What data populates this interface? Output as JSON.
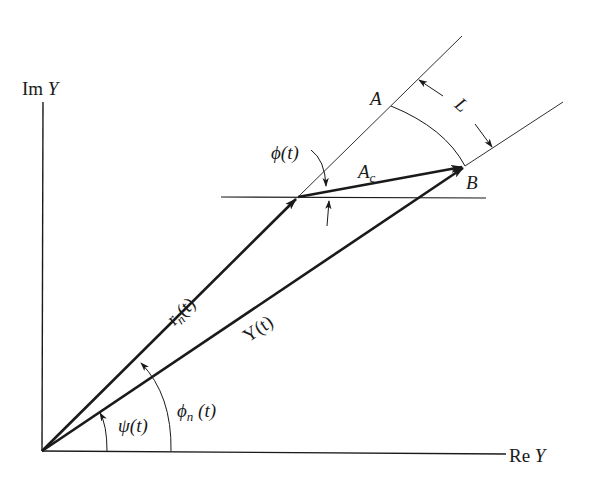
{
  "diagram": {
    "type": "phasor-diagram",
    "axes": {
      "x_label_prefix": "Re",
      "x_label_var": "Y",
      "y_label_prefix": "Im",
      "y_label_var": "Y"
    },
    "vectors": {
      "rn": {
        "label_main": "r",
        "label_sub": "n",
        "label_arg": "(t)"
      },
      "Y": {
        "label": "Y(t)"
      },
      "Ac": {
        "label_main": "A",
        "label_sub": "c"
      }
    },
    "angles": {
      "psi": {
        "label": "ψ(t)"
      },
      "phi_n": {
        "label_main": "ϕ",
        "label_sub": "n",
        "label_arg": " (t)"
      },
      "phi": {
        "label": "ϕ(t)"
      }
    },
    "points": {
      "A": "A",
      "B": "B"
    },
    "dimension": {
      "L": "L"
    },
    "colors": {
      "ink": "#1a1a1a",
      "background": "#ffffff"
    }
  }
}
